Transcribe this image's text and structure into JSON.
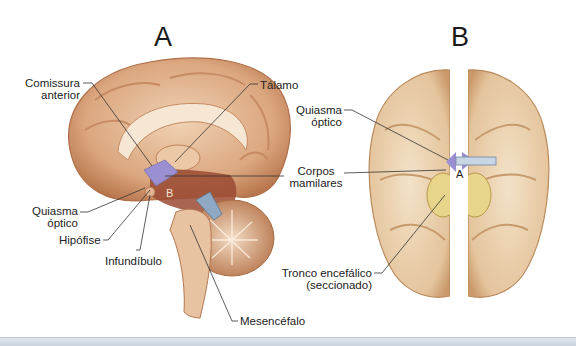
{
  "panels": {
    "a": {
      "title": "A",
      "labels": {
        "comissura_anterior_1": "Comissura",
        "comissura_anterior_2": "anterior",
        "talamo": "Tálamo",
        "quiasma_optico_1": "Quiasma",
        "quiasma_optico_2": "óptico",
        "hipofise": "Hipófise",
        "infundibulo": "Infundíbulo",
        "mesencefalo": "Mesencéfalo",
        "probe_marker": "B"
      }
    },
    "b": {
      "title": "B",
      "labels": {
        "quiasma_optico_1": "Quiasma",
        "quiasma_optico_2": "óptico",
        "tronco_1": "Tronco encefálico",
        "tronco_2": "(seccionado)",
        "probe_marker": "A"
      }
    },
    "shared": {
      "corpos_mamilares_1": "Corpos",
      "corpos_mamilares_2": "mamilares"
    }
  },
  "colors": {
    "brain_tan": "#e8c3a0",
    "brain_dark": "#b9774f",
    "brain_red": "#9a4a33",
    "chiasm_purple": "#9a8fd0",
    "brainstem_yellow": "#e6d58a",
    "probe_blue": "#8fa9c4",
    "leader_line": "#333333"
  }
}
